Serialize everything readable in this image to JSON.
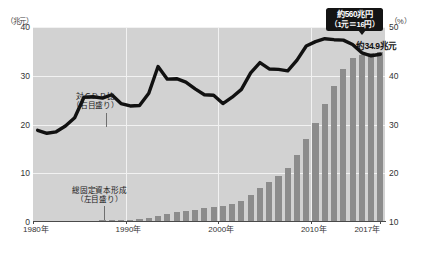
{
  "chart_data": {
    "type": "bar",
    "title": "",
    "xlabel": "",
    "ylabel": "兆元",
    "y2label": "%",
    "ylim": [
      0,
      40
    ],
    "y2lim": [
      10,
      50
    ],
    "grid": true,
    "legend_position": "in-plot-annotations",
    "x": [
      1980,
      1981,
      1982,
      1983,
      1984,
      1985,
      1986,
      1987,
      1988,
      1989,
      1990,
      1991,
      1992,
      1993,
      1994,
      1995,
      1996,
      1997,
      1998,
      1999,
      2000,
      2001,
      2002,
      2003,
      2004,
      2005,
      2006,
      2007,
      2008,
      2009,
      2010,
      2011,
      2012,
      2013,
      2014,
      2015,
      2016,
      2017
    ],
    "xtick_labels": [
      "1980年",
      "1990年",
      "2000年",
      "2010年",
      "2017年"
    ],
    "xtick_values": [
      1980,
      1990,
      2000,
      2010,
      2017
    ],
    "ytick_labels": [
      "0",
      "10",
      "20",
      "30",
      "40"
    ],
    "ytick_values": [
      0,
      10,
      20,
      30,
      40
    ],
    "y2tick_labels": [
      "10",
      "20",
      "30",
      "40",
      "50"
    ],
    "y2tick_values": [
      10,
      20,
      30,
      40,
      50
    ],
    "series": [
      {
        "name": "総固定資本形成",
        "type": "bar",
        "axis": "left",
        "unit": "兆元",
        "color": "#8c8c8c",
        "values": [
          0.09,
          0.1,
          0.12,
          0.14,
          0.17,
          0.24,
          0.29,
          0.36,
          0.45,
          0.44,
          0.46,
          0.58,
          0.8,
          1.2,
          1.59,
          1.99,
          2.31,
          2.52,
          2.8,
          3.0,
          3.29,
          3.76,
          4.39,
          5.51,
          6.91,
          8.11,
          9.49,
          11.09,
          13.83,
          17.13,
          20.26,
          24.23,
          27.99,
          31.38,
          33.69,
          34.36,
          34.72,
          34.9
        ]
      },
      {
        "name": "対GDP比",
        "type": "line",
        "axis": "right",
        "unit": "%",
        "color": "#111111",
        "values": [
          28.8,
          28.2,
          28.5,
          29.7,
          31.4,
          35.6,
          35.7,
          35.4,
          36.1,
          34.3,
          33.8,
          33.9,
          36.4,
          41.9,
          39.3,
          39.4,
          38.7,
          37.3,
          36.1,
          36.0,
          34.3,
          35.6,
          37.2,
          40.6,
          42.7,
          41.4,
          41.3,
          41.0,
          43.2,
          46.1,
          47.0,
          47.6,
          47.4,
          47.3,
          46.4,
          44.7,
          44.1,
          44.4
        ]
      }
    ],
    "annotations": [
      {
        "id": "gdp-ratio-annotation",
        "text_line1": "対ＧＤＰ比",
        "text_line2": "（右目盛り）"
      },
      {
        "id": "gfcf-annotation",
        "text_line1": "総固定資本形成",
        "text_line2": "（左目盛り）"
      },
      {
        "id": "callout",
        "text_line1": "約560兆円",
        "text_line2": "（1元＝16円）"
      },
      {
        "id": "value-label",
        "text": "約34.9兆元"
      }
    ]
  },
  "axes": {
    "left_unit": "（兆元）",
    "right_unit": "（%）"
  }
}
